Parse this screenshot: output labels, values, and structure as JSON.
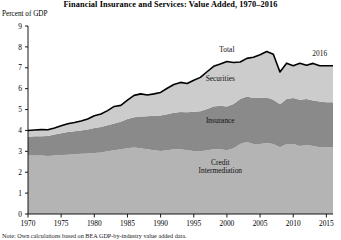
{
  "chart_data": {
    "type": "area",
    "title": "Financial Insurance and Services: Value Added, 1970–2016",
    "subtitle": "",
    "ylabel": "Percent of GDP",
    "xlabel": "",
    "ylim": [
      0,
      9
    ],
    "xlim": [
      1970,
      2016
    ],
    "grid": false,
    "stacked": true,
    "legend_position": "inline-annotations",
    "y_ticks": [
      0,
      1,
      2,
      3,
      4,
      5,
      6,
      7,
      8,
      9
    ],
    "y_tick_labels": [
      "0",
      "1",
      "2",
      "3",
      "4",
      "5",
      "6",
      "7",
      "8",
      "9"
    ],
    "x_ticks": [
      1970,
      1975,
      1980,
      1985,
      1990,
      1995,
      2000,
      2005,
      2010,
      2015
    ],
    "x_tick_labels": [
      "1970",
      "1975",
      "1980",
      "1985",
      "1990",
      "1995",
      "2000",
      "2005",
      "2010",
      "2015"
    ],
    "annotations": [
      {
        "text": "Total",
        "x": 2000,
        "y": 7.75,
        "name": "total-label"
      },
      {
        "text": "Securities",
        "x": 1999,
        "y": 6.35,
        "name": "securities-label"
      },
      {
        "text": "Insurance",
        "x": 1999,
        "y": 4.35,
        "name": "insurance-label"
      },
      {
        "text": "Credit",
        "x": 1999,
        "y": 2.35,
        "name": "credit-label-line1"
      },
      {
        "text": "Intermediation",
        "x": 1999,
        "y": 1.95,
        "name": "credit-label-line2"
      },
      {
        "text": "2016",
        "x": 2014,
        "y": 7.55,
        "name": "endpoint-year-label"
      }
    ],
    "x": [
      1970,
      1971,
      1972,
      1973,
      1974,
      1975,
      1976,
      1977,
      1978,
      1979,
      1980,
      1981,
      1982,
      1983,
      1984,
      1985,
      1986,
      1987,
      1988,
      1989,
      1990,
      1991,
      1992,
      1993,
      1994,
      1995,
      1996,
      1997,
      1998,
      1999,
      2000,
      2001,
      2002,
      2003,
      2004,
      2005,
      2006,
      2007,
      2008,
      2009,
      2010,
      2011,
      2012,
      2013,
      2014,
      2015,
      2016
    ],
    "series": [
      {
        "name": "Credit Intermediation",
        "color": "#b4b4b4",
        "values": [
          2.8,
          2.8,
          2.8,
          2.78,
          2.8,
          2.82,
          2.84,
          2.86,
          2.88,
          2.9,
          2.92,
          2.95,
          3.0,
          3.05,
          3.1,
          3.15,
          3.18,
          3.15,
          3.1,
          3.05,
          3.02,
          3.05,
          3.1,
          3.1,
          3.05,
          3.02,
          3.0,
          3.05,
          3.1,
          3.1,
          3.05,
          3.15,
          3.35,
          3.45,
          3.35,
          3.35,
          3.4,
          3.35,
          3.2,
          3.35,
          3.35,
          3.25,
          3.3,
          3.25,
          3.2,
          3.2,
          3.2
        ]
      },
      {
        "name": "Insurance",
        "color": "#8a8a8a",
        "values": [
          0.9,
          0.92,
          0.92,
          0.95,
          1.0,
          1.05,
          1.08,
          1.1,
          1.12,
          1.15,
          1.2,
          1.22,
          1.25,
          1.28,
          1.32,
          1.4,
          1.45,
          1.52,
          1.58,
          1.65,
          1.7,
          1.72,
          1.75,
          1.78,
          1.82,
          1.88,
          1.92,
          1.98,
          2.05,
          2.08,
          2.1,
          2.12,
          2.15,
          2.18,
          2.2,
          2.22,
          2.18,
          2.12,
          2.05,
          2.15,
          2.2,
          2.22,
          2.2,
          2.18,
          2.18,
          2.15,
          2.15
        ]
      },
      {
        "name": "Securities",
        "color": "#cccccc",
        "values": [
          0.3,
          0.3,
          0.32,
          0.3,
          0.32,
          0.35,
          0.4,
          0.42,
          0.45,
          0.5,
          0.58,
          0.62,
          0.7,
          0.82,
          0.78,
          0.9,
          1.05,
          1.08,
          1.02,
          1.05,
          1.1,
          1.25,
          1.35,
          1.42,
          1.38,
          1.5,
          1.62,
          1.78,
          1.92,
          2.0,
          2.15,
          1.98,
          1.78,
          1.82,
          1.95,
          2.05,
          2.2,
          2.18,
          1.55,
          1.72,
          1.55,
          1.75,
          1.62,
          1.78,
          1.72,
          1.75,
          1.75
        ]
      }
    ],
    "total": {
      "name": "Total",
      "color": "#000000",
      "values": [
        4.0,
        4.02,
        4.04,
        4.03,
        4.12,
        4.22,
        4.32,
        4.38,
        4.45,
        4.55,
        4.7,
        4.79,
        4.95,
        5.15,
        5.2,
        5.45,
        5.68,
        5.75,
        5.7,
        5.75,
        5.82,
        6.02,
        6.2,
        6.3,
        6.25,
        6.4,
        6.54,
        6.81,
        7.07,
        7.18,
        7.3,
        7.25,
        7.28,
        7.45,
        7.5,
        7.62,
        7.78,
        7.65,
        6.8,
        7.22,
        7.1,
        7.22,
        7.12,
        7.21,
        7.1,
        7.1,
        7.1
      ]
    }
  },
  "source_note": "Note: Own calculations based on BEA GDP-by-industry value added data."
}
